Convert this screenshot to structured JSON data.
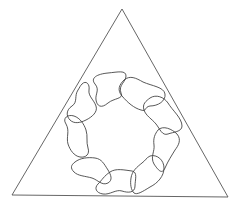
{
  "figure": {
    "width": 243,
    "height": 208,
    "background": "#ffffff",
    "stroke_color": "#3a3a3a",
    "triangle": {
      "stroke": "#555555",
      "apex": [
        122,
        9
      ],
      "bottom_left": [
        12,
        195
      ],
      "bottom_right": [
        228,
        197
      ]
    },
    "ring": {
      "center": [
        122,
        135
      ],
      "inner_radius": 32,
      "outer_radius": 60,
      "blob_count": 9
    },
    "blobs": [
      {
        "name": "blob-top-left",
        "d": "M 95 84 C 90 78, 97 74, 108 73 C 118 72, 126 70, 126 76 C 126 82, 118 85, 121 93 C 124 99, 114 98, 108 103 C 101 109, 97 106, 96 100 C 95 94, 100 90, 95 84 Z"
      },
      {
        "name": "blob-top-right",
        "d": "M 124 80 C 130 75, 136 78, 143 82 C 152 86, 164 87, 165 94 C 166 101, 158 106, 150 106 C 144 107, 147 112, 141 110 C 134 108, 128 103, 122 96 C 117 90, 119 85, 124 80 Z"
      },
      {
        "name": "blob-right-upper",
        "d": "M 150 98 C 156 94, 164 97, 168 103 C 172 110, 182 118, 182 126 C 182 132, 173 132, 168 134 C 162 136, 160 129, 156 124 C 152 119, 146 116, 144 110 C 142 104, 146 101, 150 98 Z"
      },
      {
        "name": "blob-right-lower",
        "d": "M 158 130 C 163 125, 172 129, 177 134 C 182 140, 178 146, 175 150 C 172 155, 168 161, 165 168 C 162 175, 158 170, 154 164 C 150 157, 155 151, 154 145 C 153 138, 155 134, 158 130 Z"
      },
      {
        "name": "blob-bottom-right",
        "d": "M 150 156 C 157 154, 164 160, 164 168 C 164 176, 158 183, 150 187 C 142 192, 137 195, 134 193 C 131 190, 130 184, 131 178 C 132 171, 137 167, 142 163 C 146 160, 146 158, 150 156 Z"
      },
      {
        "name": "blob-bottom",
        "d": "M 110 172 C 116 168, 124 170, 132 171 C 138 172, 135 180, 135 186 C 135 193, 128 193, 122 191 C 116 189, 110 195, 103 194 C 96 193, 94 188, 98 184 C 102 180, 104 176, 110 172 Z"
      },
      {
        "name": "blob-bottom-left",
        "d": "M 75 162 C 80 158, 88 157, 95 158 C 102 159, 104 164, 108 170 C 111 175, 113 180, 108 183 C 102 186, 98 180, 92 178 C 85 176, 78 176, 74 172 C 70 168, 71 165, 75 162 Z"
      },
      {
        "name": "blob-left-lower",
        "d": "M 66 124 C 62 118, 68 114, 74 116 C 80 118, 84 124, 86 130 C 88 136, 86 142, 88 148 C 90 154, 86 158, 80 157 C 74 156, 70 150, 68 144 C 66 137, 70 131, 66 124 Z"
      },
      {
        "name": "blob-left-upper",
        "d": "M 82 84 C 86 80, 90 84, 89 90 C 88 96, 94 100, 96 106 C 98 112, 92 117, 86 120 C 80 123, 74 124, 70 120 C 66 116, 66 110, 72 106 C 78 102, 74 96, 78 90 C 80 87, 80 86, 82 84 Z"
      }
    ]
  }
}
